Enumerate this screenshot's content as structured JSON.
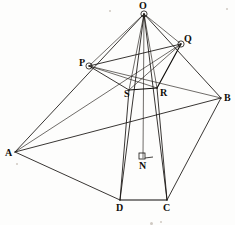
{
  "figure": {
    "type": "geometry-diagram",
    "width": 235,
    "height": 225,
    "background_color": "#fdfdfc",
    "ink_color": "#15120f",
    "vertices": [
      {
        "id": "O",
        "label": "O",
        "x": 144,
        "y": 14,
        "label_x": 139,
        "label_y": 1,
        "marker": "ring"
      },
      {
        "id": "Q",
        "label": "Q",
        "x": 181,
        "y": 44,
        "label_x": 184,
        "label_y": 34,
        "marker": "ring"
      },
      {
        "id": "P",
        "label": "P",
        "x": 89,
        "y": 66,
        "label_x": 79,
        "label_y": 58,
        "marker": "ring"
      },
      {
        "id": "R",
        "label": "R",
        "x": 157,
        "y": 88,
        "label_x": 160,
        "label_y": 88,
        "marker": "none"
      },
      {
        "id": "S",
        "label": "S",
        "x": 129,
        "y": 90,
        "label_x": 124,
        "label_y": 89,
        "marker": "none"
      },
      {
        "id": "B",
        "label": "B",
        "x": 221,
        "y": 98,
        "label_x": 224,
        "label_y": 93,
        "marker": "none"
      },
      {
        "id": "A",
        "label": "A",
        "x": 15,
        "y": 152,
        "label_x": 5,
        "label_y": 148,
        "marker": "none"
      },
      {
        "id": "N",
        "label": "N",
        "x": 143,
        "y": 158,
        "label_x": 139,
        "label_y": 161,
        "marker": "right-angle"
      },
      {
        "id": "D",
        "label": "D",
        "x": 120,
        "y": 200,
        "label_x": 116,
        "label_y": 203,
        "marker": "none"
      },
      {
        "id": "C",
        "label": "C",
        "x": 167,
        "y": 200,
        "label_x": 163,
        "label_y": 203,
        "marker": "none"
      }
    ],
    "edges": [
      {
        "name": "edge-O-A",
        "from": "O",
        "to": "A",
        "weight": "normal"
      },
      {
        "name": "edge-O-B",
        "from": "O",
        "to": "B",
        "weight": "normal"
      },
      {
        "name": "edge-O-D",
        "from": "O",
        "to": "D",
        "weight": "normal"
      },
      {
        "name": "edge-O-C",
        "from": "O",
        "to": "C",
        "weight": "normal"
      },
      {
        "name": "edge-O-P",
        "from": "O",
        "to": "P",
        "weight": "thin"
      },
      {
        "name": "edge-O-Q",
        "from": "O",
        "to": "Q",
        "weight": "thin"
      },
      {
        "name": "edge-O-S",
        "from": "O",
        "to": "S",
        "weight": "thin"
      },
      {
        "name": "edge-O-R",
        "from": "O",
        "to": "R",
        "weight": "thin"
      },
      {
        "name": "edge-O-N",
        "from": "O",
        "to": "N",
        "weight": "thin"
      },
      {
        "name": "edge-A-B",
        "from": "A",
        "to": "B",
        "weight": "normal"
      },
      {
        "name": "edge-A-D",
        "from": "A",
        "to": "D",
        "weight": "normal"
      },
      {
        "name": "edge-B-C",
        "from": "B",
        "to": "C",
        "weight": "normal"
      },
      {
        "name": "edge-D-C",
        "from": "D",
        "to": "C",
        "weight": "heavy"
      },
      {
        "name": "edge-P-Q",
        "from": "P",
        "to": "Q",
        "weight": "normal"
      },
      {
        "name": "edge-Q-R",
        "from": "Q",
        "to": "R",
        "weight": "heavy"
      },
      {
        "name": "edge-R-S",
        "from": "R",
        "to": "S",
        "weight": "heavy"
      },
      {
        "name": "edge-S-P",
        "from": "S",
        "to": "P",
        "weight": "normal"
      },
      {
        "name": "edge-P-R",
        "from": "P",
        "to": "R",
        "weight": "thin"
      },
      {
        "name": "edge-S-Q",
        "from": "S",
        "to": "Q",
        "weight": "thin"
      },
      {
        "name": "edge-S-D",
        "from": "S",
        "to": "D",
        "weight": "normal"
      },
      {
        "name": "edge-R-C",
        "from": "R",
        "to": "C",
        "weight": "normal"
      },
      {
        "name": "edge-P-B",
        "from": "P",
        "to": "B",
        "weight": "thin"
      },
      {
        "name": "edge-A-Q",
        "from": "A",
        "to": "Q",
        "weight": "thin"
      }
    ],
    "right_angle_marker": {
      "name": "right-angle-marker-N",
      "at": "N",
      "square_x": 139,
      "square_y": 153,
      "square_size": 6,
      "tick_x1": 145,
      "tick_y1": 158,
      "tick_x2": 153,
      "tick_y2": 157
    },
    "specks": [
      {
        "x": 109,
        "y": 10,
        "size": 2
      },
      {
        "x": 226,
        "y": 8,
        "size": 2
      },
      {
        "x": 16,
        "y": 163,
        "size": 2
      },
      {
        "x": 150,
        "y": 222,
        "size": 3
      },
      {
        "x": 160,
        "y": 221,
        "size": 2
      }
    ]
  }
}
